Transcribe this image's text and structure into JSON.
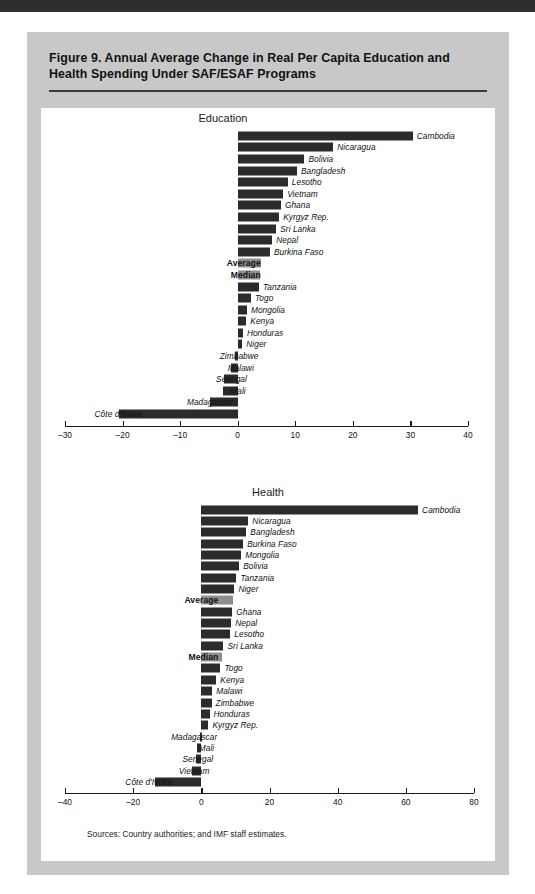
{
  "figure": {
    "title": "Figure 9. Annual Average Change in Real Per Capita Education and Health Spending Under SAF/ESAF Programs",
    "sources": "Sources:  Country authorities; and IMF staff estimates."
  },
  "colors": {
    "page_background": "#ffffff",
    "figure_background": "#c8c8c8",
    "panel_background": "#ffffff",
    "bar": "#2b2b2b",
    "aggregate_bar": "#8e8e8e",
    "axis": "#1a1a1a",
    "top_rule": "#2e2e2e"
  },
  "chart_data": [
    {
      "type": "bar",
      "title": "Education",
      "orientation": "horizontal",
      "xlabel": "",
      "ylabel": "",
      "xlim": [
        -30,
        40
      ],
      "xticks": [
        -30,
        -20,
        -10,
        0,
        10,
        20,
        30,
        40
      ],
      "xtick_labels": [
        "–30",
        "–20",
        "–10",
        "0",
        "10",
        "20",
        "30",
        "40"
      ],
      "grid": false,
      "legend": "none",
      "categories": [
        "Cambodia",
        "Nicaragua",
        "Bolivia",
        "Bangladesh",
        "Lesotho",
        "Vietnam",
        "Ghana",
        "Kyrgyz Rep.",
        "Sri Lanka",
        "Nepal",
        "Burkina Faso",
        "Average",
        "Median",
        "Tanzania",
        "Togo",
        "Mongolia",
        "Kenya",
        "Honduras",
        "Niger",
        "Zimbabwe",
        "Malawi",
        "Senegal",
        "Mali",
        "Madagascar",
        "Côte d'Ivoire"
      ],
      "values": [
        30.4,
        16.6,
        11.6,
        10.3,
        8.7,
        7.9,
        7.5,
        7.2,
        6.7,
        6.0,
        5.6,
        4.0,
        3.8,
        3.7,
        2.3,
        1.6,
        1.5,
        0.9,
        0.8,
        -0.4,
        -1.2,
        -2.4,
        -2.6,
        -4.8,
        -20.7
      ],
      "aggregate_rows": [
        "Average",
        "Median"
      ]
    },
    {
      "type": "bar",
      "title": "Health",
      "orientation": "horizontal",
      "xlabel": "",
      "ylabel": "",
      "xlim": [
        -40,
        80
      ],
      "xticks": [
        -40,
        -20,
        0,
        20,
        40,
        60,
        80
      ],
      "xtick_labels": [
        "–40",
        "–20",
        "0",
        "20",
        "40",
        "60",
        "80"
      ],
      "grid": false,
      "legend": "none",
      "categories": [
        "Cambodia",
        "Nicaragua",
        "Bangladesh",
        "Burkina Faso",
        "Mongolia",
        "Bolivia",
        "Tanzania",
        "Niger",
        "Average",
        "Ghana",
        "Nepal",
        "Lesotho",
        "Sri Lanka",
        "Median",
        "Togo",
        "Kenya",
        "Malawi",
        "Zimbabwe",
        "Honduras",
        "Kyrgyz Rep.",
        "Madagascar",
        "Mali",
        "Senegal",
        "Vietnam",
        "Côte d'Ivoire"
      ],
      "values": [
        63.6,
        13.8,
        13.2,
        12.3,
        11.7,
        11.1,
        10.3,
        9.7,
        9.4,
        9.1,
        8.8,
        8.5,
        6.5,
        6.2,
        5.6,
        4.4,
        3.2,
        3.0,
        2.4,
        2.1,
        -0.3,
        -1.2,
        -1.5,
        -2.6,
        -13.5
      ],
      "aggregate_rows": [
        "Average",
        "Median"
      ]
    }
  ]
}
